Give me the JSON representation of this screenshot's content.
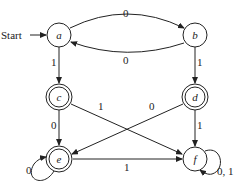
{
  "diagram": {
    "type": "finite-state-automaton",
    "start_label": "Start",
    "start_state": "a",
    "states": [
      {
        "id": "a",
        "label": "a",
        "accepting": false
      },
      {
        "id": "b",
        "label": "b",
        "accepting": false
      },
      {
        "id": "c",
        "label": "c",
        "accepting": true
      },
      {
        "id": "d",
        "label": "d",
        "accepting": true
      },
      {
        "id": "e",
        "label": "e",
        "accepting": true
      },
      {
        "id": "f",
        "label": "f",
        "accepting": false
      }
    ],
    "transitions": [
      {
        "from": "a",
        "to": "b",
        "label": "0"
      },
      {
        "from": "b",
        "to": "a",
        "label": "0"
      },
      {
        "from": "a",
        "to": "c",
        "label": "1"
      },
      {
        "from": "b",
        "to": "d",
        "label": "1"
      },
      {
        "from": "c",
        "to": "e",
        "label": "0"
      },
      {
        "from": "c",
        "to": "f",
        "label": "1"
      },
      {
        "from": "d",
        "to": "e",
        "label": "0"
      },
      {
        "from": "d",
        "to": "f",
        "label": "1"
      },
      {
        "from": "e",
        "to": "e",
        "label": "0"
      },
      {
        "from": "e",
        "to": "f",
        "label": "1"
      },
      {
        "from": "f",
        "to": "f",
        "label": "0, 1"
      }
    ]
  }
}
